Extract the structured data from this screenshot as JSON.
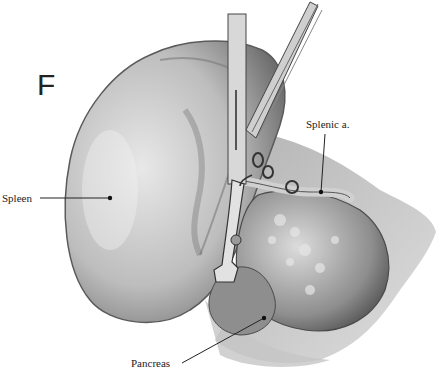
{
  "figure": {
    "panel_letter": "F",
    "labels": {
      "spleen": "Spleen",
      "splenic_artery": "Splenic a.",
      "pancreas": "Pancreas"
    },
    "colors": {
      "background": "#ffffff",
      "ink": "#222222",
      "tissue_light": "#d9d9d9",
      "tissue_mid": "#9a9a9a",
      "tissue_dark": "#4a4a4a"
    }
  }
}
